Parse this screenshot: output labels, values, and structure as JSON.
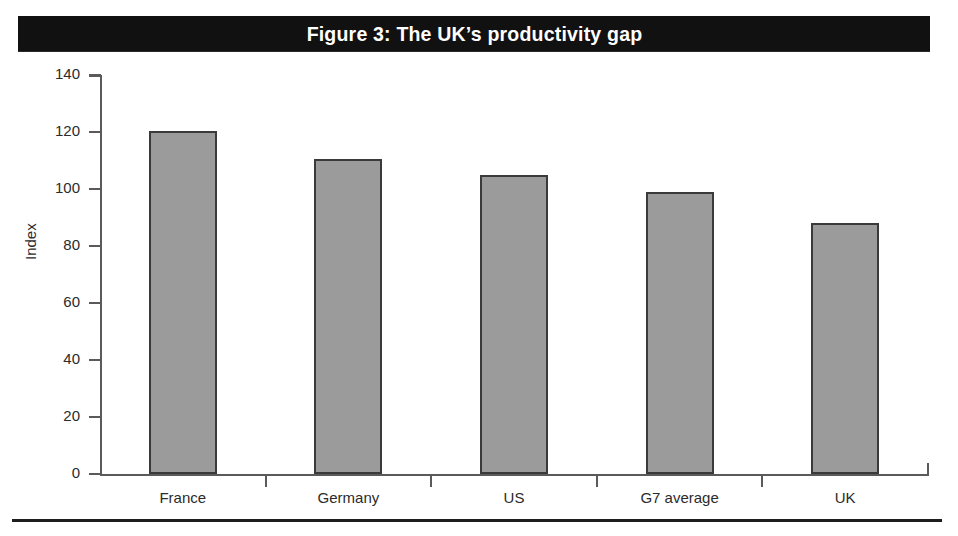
{
  "figure": {
    "title": "Figure 3: The UK’s productivity gap",
    "caption_partial": "",
    "banner_color": "#111111",
    "banner_text_color": "#ffffff",
    "bar_fill_color": "#9b9b9b",
    "bar_border_color": "#3a3a3a",
    "axis_color": "#5a5a5a"
  },
  "chart_data": {
    "type": "bar",
    "title": "Figure 3: The UK’s productivity gap",
    "xlabel": "",
    "ylabel": "Index",
    "categories": [
      "France",
      "Germany",
      "US",
      "G7 average",
      "UK"
    ],
    "values": [
      120.5,
      110.5,
      105,
      99,
      88
    ],
    "ylim": [
      0,
      140
    ],
    "yticks": [
      0,
      20,
      40,
      60,
      80,
      100,
      120,
      140
    ],
    "ytick_labels": [
      "0",
      "20",
      "40",
      "60",
      "80",
      "100",
      "120",
      "140"
    ],
    "grid": false,
    "legend": null,
    "series": [
      {
        "name": "Index",
        "values": [
          120.5,
          110.5,
          105,
          99,
          88
        ]
      }
    ]
  }
}
